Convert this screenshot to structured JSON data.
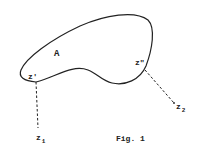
{
  "figure": {
    "caption": "Fig. 1",
    "region_label": "A",
    "points": {
      "z_prime": "z'",
      "z_double_prime": "z\"",
      "z1_base": "z",
      "z1_sub": "1",
      "z2_base": "z",
      "z2_sub": "2"
    },
    "colors": {
      "stroke": "#222222",
      "background": "#ffffff"
    }
  }
}
